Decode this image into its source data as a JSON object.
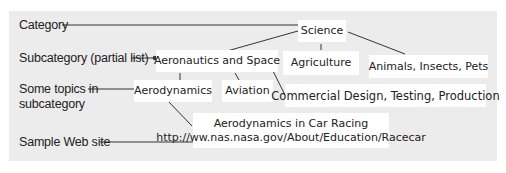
{
  "labels": {
    "category": "Category",
    "subcategory": "Subcategory (partial list)",
    "topics_line1": "Some topics in",
    "topics_line2": "subcategory",
    "sample": "Sample Web site"
  },
  "nodes": {
    "science": "Science",
    "aeronautics": "Aeronautics and Space",
    "agriculture": "Agriculture",
    "animals": "Animals, Insects, Pets",
    "aerodynamics": "Aerodynamics",
    "aviation": "Aviation",
    "commercial": "Commercial Design, Testing, Production",
    "site_title": "Aerodynamics in Car Racing",
    "site_url": "http://ww.nas.nasa.gov/About/Education/Racecar"
  },
  "colors": {
    "panel": "#ececec",
    "box": "#ffffff",
    "line": "#333333"
  }
}
